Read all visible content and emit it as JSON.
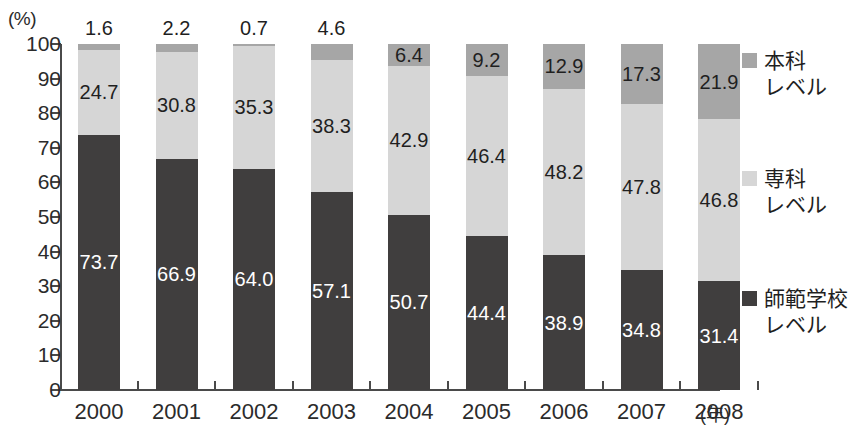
{
  "chart_data": {
    "type": "bar",
    "subtype": "stacked-percentage",
    "title": "",
    "xlabel": "年",
    "ylabel": "(%)",
    "ylim": [
      0,
      100
    ],
    "ytick_step": 10,
    "yticks": [
      "100",
      "90",
      "80",
      "70",
      "60",
      "50",
      "40",
      "30",
      "20",
      "10",
      "0"
    ],
    "grid": false,
    "legend_position": "right",
    "categories": [
      "2000",
      "2001",
      "2002",
      "2003",
      "2004",
      "2005",
      "2006",
      "2007",
      "2008"
    ],
    "series": [
      {
        "name": "本科\nレベル",
        "name_plain": "本科レベル",
        "color": "#a6a6a6",
        "label_color": "#1f1f1f",
        "values": [
          1.6,
          2.2,
          0.7,
          4.6,
          6.4,
          9.2,
          12.9,
          17.3,
          21.9
        ],
        "labels": [
          "1.6",
          "2.2",
          "0.7",
          "4.6",
          "6.4",
          "9.2",
          "12.9",
          "17.3",
          "21.9"
        ],
        "label_placement": [
          "outside",
          "outside",
          "outside",
          "outside",
          "inside",
          "inside",
          "inside",
          "inside",
          "inside"
        ]
      },
      {
        "name": "専科\nレベル",
        "name_plain": "専科レベル",
        "color": "#d6d6d6",
        "label_color": "#1f1f1f",
        "values": [
          24.7,
          30.8,
          35.3,
          38.3,
          42.9,
          46.4,
          48.2,
          47.8,
          46.8
        ],
        "labels": [
          "24.7",
          "30.8",
          "35.3",
          "38.3",
          "42.9",
          "46.4",
          "48.2",
          "47.8",
          "46.8"
        ],
        "label_placement": [
          "inside",
          "inside",
          "inside",
          "inside",
          "inside",
          "inside",
          "inside",
          "inside",
          "inside"
        ]
      },
      {
        "name": "師範学校\nレベル",
        "name_plain": "師範学校レベル",
        "color": "#403e3e",
        "label_color": "#ffffff",
        "values": [
          73.7,
          66.9,
          64.0,
          57.1,
          50.7,
          44.4,
          38.9,
          34.8,
          31.4
        ],
        "labels": [
          "73.7",
          "66.9",
          "64.0",
          "57.1",
          "50.7",
          "44.4",
          "38.9",
          "34.8",
          "31.4"
        ],
        "label_placement": [
          "inside",
          "inside",
          "inside",
          "inside",
          "inside",
          "inside",
          "inside",
          "inside",
          "inside"
        ]
      }
    ],
    "axis_color": "#4a4a4a",
    "background": "#ffffff"
  },
  "legend": {
    "items": [
      {
        "label": "本科\nレベル",
        "color": "#a6a6a6"
      },
      {
        "label": "専科\nレベル",
        "color": "#d6d6d6"
      },
      {
        "label": "師範学校\nレベル",
        "color": "#403e3e"
      }
    ]
  }
}
